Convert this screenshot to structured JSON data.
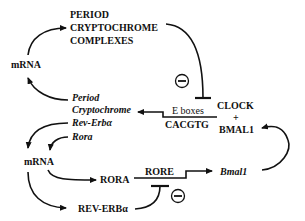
{
  "diagram": {
    "nodes": {
      "period_complex": [
        "PERIOD",
        "CRYPTOCHROME",
        "COMPLEXES"
      ],
      "mrna_top": "mRNA",
      "genes_top": [
        "Period",
        "Cryptochrome"
      ],
      "genes_bottom": [
        "Rev-Erbα",
        "Rora"
      ],
      "mrna_bottom": "mRNA",
      "ebox": "E boxes",
      "ebox_seq": "CACGTG",
      "clock": "CLOCK",
      "plus": "+",
      "bmal1_protein": "BMAL1",
      "rora": "RORA",
      "rore": "RORE",
      "bmal1_gene": "Bmal1",
      "rev_erb": "REV-ERBα"
    },
    "inhibition_symbol": "−",
    "edges": [
      {
        "from": "mRNA",
        "to": "PERIOD CRYPTOCHROME COMPLEXES",
        "type": "activation"
      },
      {
        "from": "PERIOD CRYPTOCHROME COMPLEXES",
        "to": "CLOCK + BMAL1",
        "type": "inhibition"
      },
      {
        "from": "CLOCK + BMAL1",
        "to": "Period/Cryptochrome",
        "via": "E boxes CACGTG",
        "type": "activation"
      },
      {
        "from": "Period/Cryptochrome",
        "to": "mRNA",
        "type": "activation"
      },
      {
        "from": "Rev-Erbα",
        "to": "mRNA",
        "type": "activation"
      },
      {
        "from": "Rora",
        "to": "mRNA",
        "type": "activation"
      },
      {
        "from": "mRNA",
        "to": "RORA",
        "type": "activation"
      },
      {
        "from": "mRNA",
        "to": "REV-ERBα",
        "type": "activation"
      },
      {
        "from": "RORA",
        "to": "Bmal1",
        "via": "RORE",
        "type": "activation"
      },
      {
        "from": "REV-ERBα",
        "to": "RORE",
        "type": "inhibition"
      },
      {
        "from": "Bmal1",
        "to": "BMAL1",
        "type": "activation"
      }
    ]
  }
}
